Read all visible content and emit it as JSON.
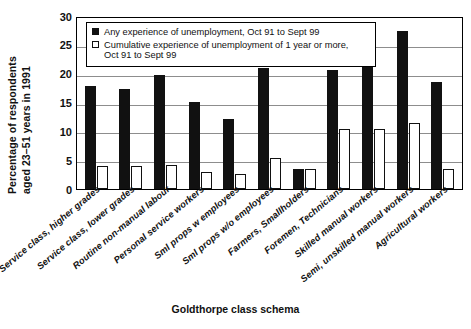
{
  "chart_data": {
    "type": "bar",
    "title": "",
    "xlabel": "Goldthorpe class schema",
    "ylabel": "Percentage of respondents aged 23–51 years in 1991",
    "ylim": [
      0,
      30
    ],
    "yticks": [
      0,
      5,
      10,
      15,
      20,
      25,
      30
    ],
    "grid": true,
    "legend_position": "top-inside",
    "categories": [
      "Service class, higher grades",
      "Service class, lower grades",
      "Routine non-manual labour",
      "Personal service workers",
      "Sml props w employees",
      "Sml props w/o employees",
      "Farmers, Smallholders",
      "Foremen, Technicians",
      "Skilled manual workers",
      "Semi, unskilled manual workers",
      "Agricultural workers"
    ],
    "series": [
      {
        "name": "Any experience of unemployment, Oct 91 to Sept 99",
        "color": "#111111",
        "values": [
          18.0,
          17.5,
          20.0,
          15.3,
          12.2,
          21.3,
          3.5,
          20.8,
          29.3,
          27.8,
          18.7
        ]
      },
      {
        "name": "Cumulative experience of unemployment of 1 year or more, Oct 91 to Sept 99",
        "color": "#ffffff",
        "values": [
          4.0,
          4.0,
          4.3,
          3.0,
          2.7,
          5.5,
          3.5,
          10.5,
          10.5,
          11.5,
          3.5
        ]
      }
    ]
  },
  "legend": {
    "entries": [
      {
        "icon": "filled-square-swatch",
        "label": "Any experience of unemployment, Oct 91 to Sept 99"
      },
      {
        "icon": "empty-square-swatch",
        "label": "Cumulative experience of unemployment of 1 year or more,\nOct 91 to Sept 99"
      }
    ]
  },
  "axes": {
    "y_title_line1": "Percentage of respondents",
    "y_title_line2": "aged 23–51 years in 1991",
    "x_title": "Goldthorpe class schema",
    "ytick_labels": [
      "30",
      "25",
      "20",
      "15",
      "10",
      "5",
      "0"
    ]
  }
}
